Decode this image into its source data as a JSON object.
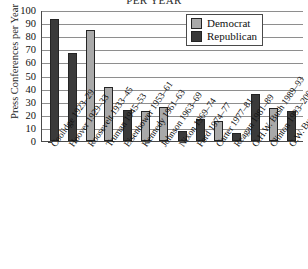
{
  "chart_data": {
    "type": "bar",
    "title": "PER YEAR",
    "xlabel": "",
    "ylabel": "Press Conferences per Year",
    "ylim": [
      0,
      100
    ],
    "ytick_step": 10,
    "yticks": [
      100,
      90,
      80,
      70,
      60,
      50,
      40,
      30,
      20,
      10,
      0
    ],
    "grid": true,
    "legend_position": "top-right",
    "legend": [
      {
        "name": "Democrat",
        "color": "#a9a9a9"
      },
      {
        "name": "Republican",
        "color": "#3a3a3a"
      }
    ],
    "categories": [
      "Coolidge 1923–29",
      "Hoover 1929–33",
      "Roosevelt 1933–45",
      "Truman 1945–53",
      "Eisenhower 1953–61",
      "Kennedy 1961–63",
      "Johnson 1963–69",
      "Nixon 1969–74",
      "Ford 1974–77",
      "Carter 1977–81",
      "Reagan 1981–89",
      "G.H.W. Bush 1989–93",
      "Clinton 1993–2001",
      "G.W. Bush 2001–04"
    ],
    "values": [
      93,
      67,
      85,
      41,
      24,
      23,
      26,
      8,
      17,
      15,
      6,
      36,
      25,
      23
    ],
    "parties": [
      "Republican",
      "Republican",
      "Democrat",
      "Democrat",
      "Republican",
      "Democrat",
      "Democrat",
      "Republican",
      "Republican",
      "Democrat",
      "Republican",
      "Republican",
      "Democrat",
      "Republican"
    ],
    "colors": {
      "democrat": "#a9a9a9",
      "republican": "#3a3a3a",
      "axis": "#4a4a4a",
      "grid": "#8e8e8e",
      "bar_outline": "#242424"
    }
  }
}
